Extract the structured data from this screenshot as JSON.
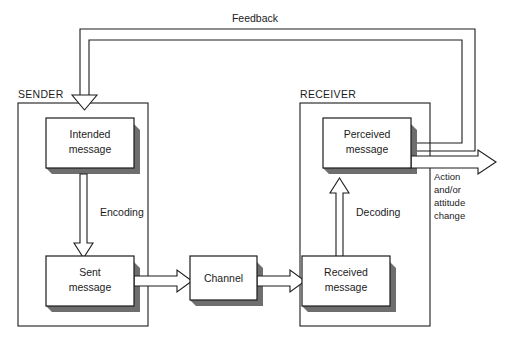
{
  "diagram": {
    "groups": [
      {
        "id": "sender",
        "label": "SENDER"
      },
      {
        "id": "receiver",
        "label": "RECEIVER"
      }
    ],
    "boxes": [
      {
        "id": "intended",
        "line1": "Intended",
        "line2": "message"
      },
      {
        "id": "sent",
        "line1": "Sent",
        "line2": "message"
      },
      {
        "id": "channel",
        "line1": "Channel",
        "line2": ""
      },
      {
        "id": "received",
        "line1": "Received",
        "line2": "message"
      },
      {
        "id": "perceived",
        "line1": "Perceived",
        "line2": "message"
      }
    ],
    "edge_labels": [
      {
        "id": "encoding",
        "label": "Encoding"
      },
      {
        "id": "decoding",
        "label": "Decoding"
      },
      {
        "id": "feedback",
        "label": "Feedback"
      }
    ],
    "outcome": {
      "lines": [
        "Action",
        "and/or",
        "attitude",
        "change"
      ]
    },
    "colors": {
      "stroke": "#1c1c1c",
      "box_fill": "#ffffff",
      "shadow": "#6e6e6e",
      "background": "#ffffff",
      "text": "#1c1c1c"
    }
  }
}
